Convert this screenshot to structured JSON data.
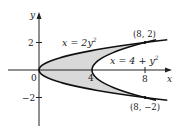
{
  "chart_data": {
    "type": "area",
    "title": "",
    "xlabel": "x",
    "ylabel": "y",
    "x_ticks": [
      {
        "value": 4,
        "label": "4"
      },
      {
        "value": 8,
        "label": "8"
      }
    ],
    "y_ticks": [
      {
        "value": 2,
        "label": "2"
      },
      {
        "value": -2,
        "label": "−2"
      }
    ],
    "origin_label": "0",
    "xlim": [
      -3,
      10.5
    ],
    "ylim": [
      -4.5,
      3.2
    ],
    "curves": [
      {
        "name": "x = 2y²",
        "equation": "x=2y^2",
        "y_range": [
          -2.2,
          2.2
        ]
      },
      {
        "name": "x = 4 + y²",
        "equation": "x=4+y^2",
        "y_range": [
          -2.2,
          2.2
        ]
      }
    ],
    "shaded_region": {
      "between": [
        "x=2y^2",
        "x=4+y^2"
      ],
      "y_range": [
        -2,
        2
      ],
      "color": "#d9d9d9"
    },
    "points": [
      {
        "x": 8,
        "y": 2,
        "label": "(8, 2)"
      },
      {
        "x": 8,
        "y": -2,
        "label": "(8, −2)"
      }
    ],
    "grid": false
  },
  "labels": {
    "curve1": "x = 2y",
    "curve1_sup": "2",
    "curve2": "x = 4 + y",
    "curve2_sup": "2",
    "point_top": "(8, 2)",
    "point_bottom": "(8, −2)",
    "axis_x": "x",
    "axis_y": "y",
    "tick_x4": "4",
    "tick_x8": "8",
    "tick_y2": "2",
    "tick_ym2": "−2",
    "origin": "0"
  }
}
